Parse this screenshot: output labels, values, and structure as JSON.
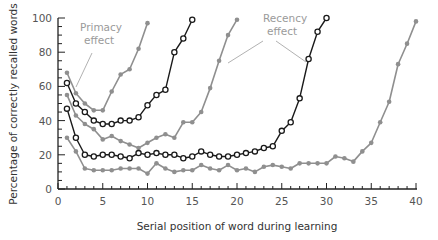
{
  "chart_data": {
    "type": "line",
    "title": "",
    "xlabel": "Serial position of word during learning",
    "ylabel": "Percentage of correctly recalled words",
    "xlim": [
      0,
      40
    ],
    "ylim": [
      0,
      100
    ],
    "x_ticks": [
      0,
      5,
      10,
      15,
      20,
      25,
      30,
      35,
      40
    ],
    "y_ticks": [
      0,
      20,
      40,
      60,
      80,
      100
    ],
    "grid": false,
    "legend": null,
    "annotations": [
      {
        "text_lines": [
          "Primacy",
          "effect"
        ],
        "position": [
          68,
          31
        ]
      },
      {
        "text_lines": [
          "Recency",
          "effect"
        ],
        "position": [
          251,
          22
        ]
      }
    ],
    "series": [
      {
        "name": "10-word list",
        "style": "gray-filled",
        "x": [
          1,
          2,
          3,
          4,
          5,
          6,
          7,
          8,
          9,
          10
        ],
        "values": [
          68,
          56,
          50,
          46,
          46,
          57,
          67,
          70,
          82,
          97
        ]
      },
      {
        "name": "15-word list",
        "style": "black-open",
        "x": [
          1,
          2,
          3,
          4,
          5,
          6,
          7,
          8,
          9,
          10,
          11,
          12,
          13,
          14,
          15
        ],
        "values": [
          62,
          50,
          45,
          40,
          38,
          38,
          40,
          40,
          42,
          49,
          55,
          58,
          80,
          88,
          99
        ]
      },
      {
        "name": "20-word list",
        "style": "gray-filled",
        "x": [
          1,
          2,
          3,
          4,
          5,
          6,
          7,
          8,
          9,
          10,
          11,
          12,
          13,
          14,
          15,
          16,
          17,
          18,
          19,
          20
        ],
        "values": [
          55,
          43,
          38,
          35,
          29,
          31,
          28,
          26,
          24,
          27,
          30,
          32,
          30,
          39,
          39,
          45,
          59,
          75,
          90,
          99
        ]
      },
      {
        "name": "30-word list",
        "style": "black-open",
        "x": [
          1,
          2,
          3,
          4,
          5,
          6,
          7,
          8,
          9,
          10,
          11,
          12,
          13,
          14,
          15,
          16,
          17,
          18,
          19,
          20,
          21,
          22,
          23,
          24,
          25,
          26,
          27,
          28,
          29,
          30
        ],
        "values": [
          47,
          30,
          20,
          19,
          20,
          20,
          19,
          18,
          21,
          20,
          21,
          20,
          20,
          18,
          19,
          22,
          20,
          19,
          19,
          20,
          21,
          22,
          24,
          25,
          34,
          39,
          53,
          76,
          92,
          100
        ]
      },
      {
        "name": "40-word list",
        "style": "gray-filled",
        "x": [
          1,
          2,
          3,
          4,
          5,
          6,
          7,
          8,
          9,
          10,
          11,
          12,
          13,
          14,
          15,
          16,
          17,
          18,
          19,
          20,
          21,
          22,
          23,
          24,
          25,
          26,
          27,
          28,
          29,
          30,
          31,
          32,
          33,
          34,
          35,
          36,
          37,
          38,
          39,
          40
        ],
        "values": [
          30,
          22,
          12,
          11,
          11,
          11,
          12,
          12,
          12,
          9,
          15,
          12,
          10,
          11,
          11,
          14,
          12,
          11,
          14,
          11,
          12,
          10,
          13,
          14,
          13,
          12,
          15,
          15,
          15,
          15,
          19,
          18,
          16,
          22,
          27,
          39,
          51,
          73,
          85,
          98
        ]
      }
    ]
  },
  "colors": {
    "gray": "#8f8f8f",
    "black": "#1a1a1a",
    "annotation": "#a8a8a8"
  }
}
